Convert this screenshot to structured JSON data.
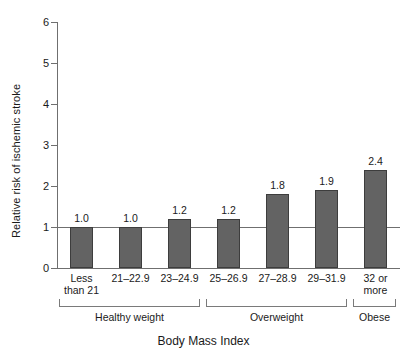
{
  "chart_data": {
    "type": "bar",
    "title": "",
    "xlabel": "Body Mass Index",
    "ylabel": "Relative risk of ischemic stroke",
    "categories": [
      "Less\nthan 21",
      "21–22.9",
      "23–24.9",
      "25–26.9",
      "27–28.9",
      "29–31.9",
      "32 or\nmore"
    ],
    "category_lines": [
      [
        "Less",
        "than 21"
      ],
      [
        "21–22.9"
      ],
      [
        "23–24.9"
      ],
      [
        "25–26.9"
      ],
      [
        "27–28.9"
      ],
      [
        "29–31.9"
      ],
      [
        "32 or",
        "more"
      ]
    ],
    "values": [
      1.0,
      1.0,
      1.2,
      1.2,
      1.8,
      1.9,
      2.4
    ],
    "value_labels": [
      "1.0",
      "1.0",
      "1.2",
      "1.2",
      "1.8",
      "1.9",
      "2.4"
    ],
    "ylim": [
      0,
      6
    ],
    "ytick_labels": [
      "0",
      "1",
      "2",
      "3",
      "4",
      "5",
      "6"
    ],
    "ytick_values": [
      0,
      1,
      2,
      3,
      4,
      5,
      6
    ],
    "grid": false,
    "legend": "none",
    "reference_line": 1.0,
    "bar_color": "#636363",
    "bar_border_color": "#3d3d3d",
    "axis_color": "#6f6f6f",
    "groups": [
      {
        "label": "Healthy weight",
        "start_index": 0,
        "end_index": 2
      },
      {
        "label": "Overweight",
        "start_index": 3,
        "end_index": 5
      },
      {
        "label": "Obese",
        "start_index": 6,
        "end_index": 6
      }
    ]
  }
}
